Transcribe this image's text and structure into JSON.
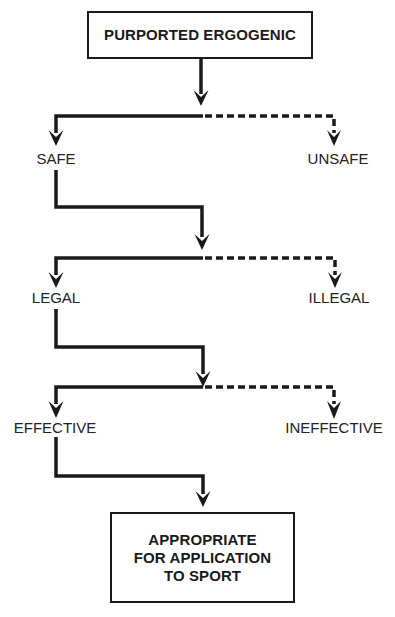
{
  "diagram": {
    "type": "decision-flowchart",
    "start_node": {
      "label": "PURPORTED ERGOGENIC"
    },
    "decisions": [
      {
        "positive": "SAFE",
        "negative": "UNSAFE"
      },
      {
        "positive": "LEGAL",
        "negative": "ILLEGAL"
      },
      {
        "positive": "EFFECTIVE",
        "negative": "INEFFECTIVE"
      }
    ],
    "end_node": {
      "lines": [
        "APPROPRIATE",
        "FOR APPLICATION",
        "TO SPORT"
      ]
    },
    "styles": {
      "positive_path": "solid",
      "negative_path": "dashed",
      "stroke_color": "#1a1a1a"
    }
  }
}
